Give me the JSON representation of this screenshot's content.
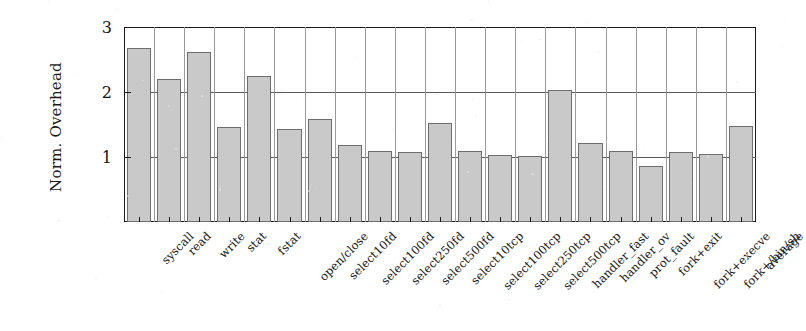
{
  "chart_data": {
    "type": "bar",
    "title": "",
    "xlabel": "",
    "ylabel": "Norm. Overhead",
    "ylim": [
      0.0,
      3.0
    ],
    "yticks": [
      1,
      2,
      3
    ],
    "ytick_labels": [
      "1",
      "2",
      "3"
    ],
    "grid": true,
    "legend": "none",
    "reference_line": 1.0,
    "bar_color": "#c9c9c9",
    "bar_edge_color": "#6e6e6e",
    "categories": [
      "syscall",
      "read",
      "write",
      "stat",
      "fstat",
      "open/close",
      "select10fd",
      "select100fd",
      "select250fd",
      "select500fd",
      "select10tcp",
      "select100tcp",
      "select250tcp",
      "select500tcp",
      "handler_fast",
      "handler_ov",
      "prot_fault",
      "fork+exit",
      "fork+execve",
      "fork+/bin/sh",
      "average"
    ],
    "values": [
      2.68,
      2.2,
      2.62,
      1.46,
      2.24,
      1.43,
      1.58,
      1.19,
      1.09,
      1.08,
      1.53,
      1.1,
      1.03,
      1.02,
      2.03,
      1.21,
      1.1,
      0.86,
      1.07,
      1.05,
      1.47
    ]
  }
}
